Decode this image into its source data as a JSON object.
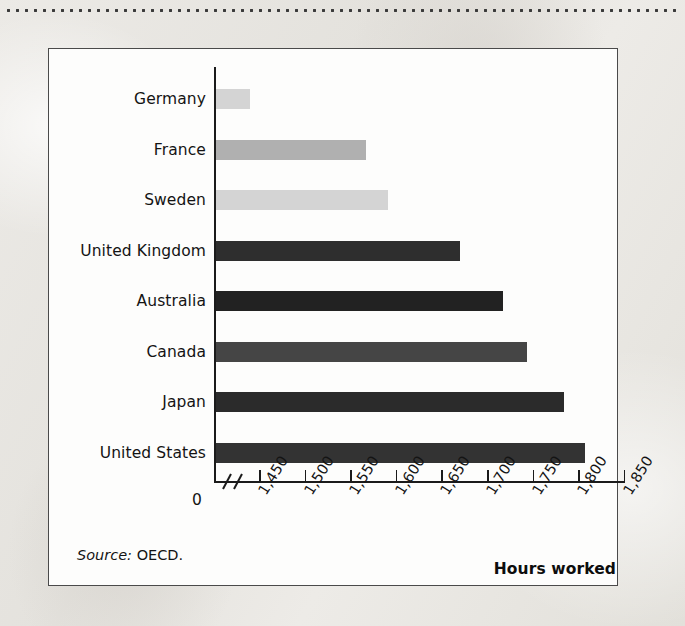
{
  "figure": {
    "source_label": "Source:",
    "source_value": "OECD."
  },
  "chart_data": {
    "type": "bar",
    "orientation": "horizontal",
    "title": "",
    "xlabel": "Hours worked",
    "ylabel": "",
    "categories": [
      "Germany",
      "France",
      "Sweden",
      "United Kingdom",
      "Australia",
      "Canada",
      "Japan",
      "United States"
    ],
    "values": [
      1440,
      1567,
      1591,
      1670,
      1717,
      1744,
      1784,
      1808
    ],
    "bar_colors": [
      "#d4d4d4",
      "#b0b0b0",
      "#d4d4d4",
      "#2e2e2e",
      "#222222",
      "#454545",
      "#2b2b2b",
      "#333333"
    ],
    "xlim": [
      1400,
      1850
    ],
    "axis_break": true,
    "zero_tick_label": "0",
    "xticks": [
      1450,
      1500,
      1550,
      1600,
      1650,
      1700,
      1750,
      1800,
      1850
    ],
    "xtick_labels": [
      "1,450",
      "1,500",
      "1,550",
      "1,600",
      "1,650",
      "1,700",
      "1,750",
      "1,800",
      "1,850"
    ],
    "grid": false,
    "legend": false
  }
}
